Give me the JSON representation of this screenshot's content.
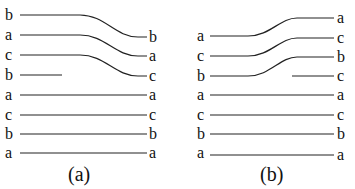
{
  "panels": [
    {
      "caption": "(a)",
      "left_labels": [
        "b",
        "a",
        "c",
        "b",
        "a",
        "c",
        "b",
        "a"
      ],
      "right_labels": [
        "b",
        "a",
        "c",
        "a",
        "c",
        "b",
        "a"
      ],
      "description": "Three strands (b, a, c) shift down one position; a short b strand terminates"
    },
    {
      "caption": "(b)",
      "left_labels": [
        "a",
        "c",
        "b",
        "a",
        "c",
        "b",
        "a"
      ],
      "right_labels": [
        "a",
        "c",
        "b",
        "c",
        "a",
        "c",
        "b",
        "a"
      ],
      "description": "Three strands (a, c, b) shift up one position; a short c strand begins"
    }
  ]
}
